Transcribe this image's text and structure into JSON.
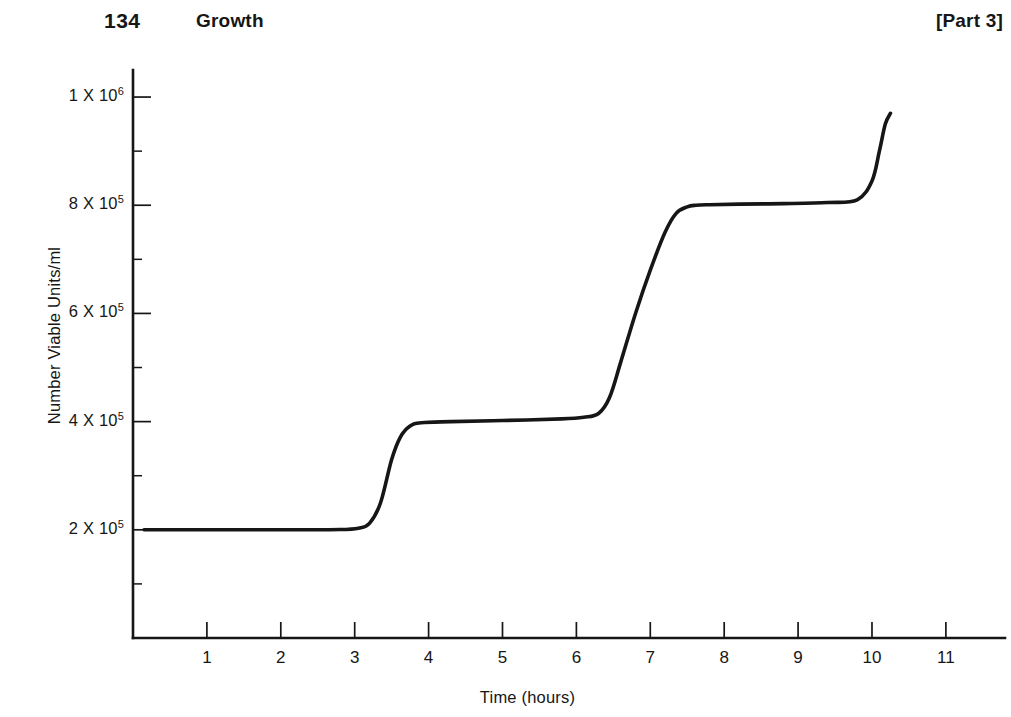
{
  "header": {
    "page_number": "134",
    "chapter_title": "Growth",
    "part_label": "[Part 3]"
  },
  "chart_data": {
    "type": "line",
    "title": "",
    "xlabel": "Time (hours)",
    "ylabel": "Number Viable Units/ml",
    "xlim": [
      0,
      11.8
    ],
    "ylim": [
      0,
      1050000
    ],
    "grid": false,
    "legend": null,
    "x_ticks": [
      "1",
      "2",
      "3",
      "4",
      "5",
      "6",
      "7",
      "8",
      "9",
      "10",
      "11"
    ],
    "x_tick_values": [
      1,
      2,
      3,
      4,
      5,
      6,
      7,
      8,
      9,
      10,
      11
    ],
    "y_ticks": [
      {
        "mantissa": "2",
        "multiplier": "X",
        "base": "10",
        "exponent": "5",
        "value": 200000
      },
      {
        "mantissa": "4",
        "multiplier": "X",
        "base": "10",
        "exponent": "5",
        "value": 400000
      },
      {
        "mantissa": "6",
        "multiplier": "X",
        "base": "10",
        "exponent": "5",
        "value": 600000
      },
      {
        "mantissa": "8",
        "multiplier": "X",
        "base": "10",
        "exponent": "5",
        "value": 800000
      },
      {
        "mantissa": "1",
        "multiplier": "X",
        "base": "10",
        "exponent": "6",
        "value": 1000000
      }
    ],
    "series": [
      {
        "name": "Synchronous growth",
        "color": "#161616",
        "x": [
          0.15,
          1.0,
          2.0,
          2.8,
          3.05,
          3.2,
          3.35,
          3.5,
          3.62,
          3.75,
          3.9,
          4.3,
          5.0,
          5.8,
          6.1,
          6.3,
          6.45,
          6.6,
          6.8,
          7.0,
          7.2,
          7.35,
          7.5,
          7.62,
          7.8,
          8.2,
          8.8,
          9.4,
          9.8,
          10.0,
          10.1,
          10.18,
          10.25
        ],
        "y": [
          200000,
          200000,
          200000,
          200500,
          203000,
          212000,
          250000,
          330000,
          372000,
          392000,
          398000,
          400000,
          402000,
          405000,
          408000,
          415000,
          445000,
          510000,
          600000,
          680000,
          750000,
          785000,
          797000,
          800000,
          801000,
          802000,
          803000,
          805000,
          810000,
          845000,
          900000,
          950000,
          970000
        ]
      }
    ],
    "annotations": []
  }
}
